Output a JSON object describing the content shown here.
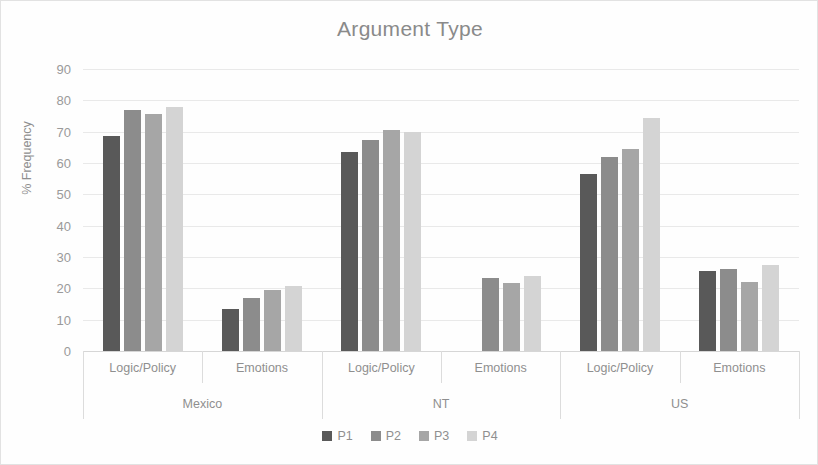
{
  "chart_data": {
    "type": "bar",
    "title": "Argument Type",
    "xlabel": "",
    "ylabel": "% Frequency",
    "ylim": [
      0,
      90
    ],
    "ytick_step": 10,
    "yticks": [
      90,
      80,
      70,
      60,
      50,
      40,
      30,
      20,
      10,
      0
    ],
    "grid": true,
    "legend_position": "bottom",
    "groups": [
      "Mexico",
      "NT",
      "US"
    ],
    "subcategories": [
      "Logic/Policy",
      "Emotions"
    ],
    "categories": [
      "Mexico - Logic/Policy",
      "Mexico - Emotions",
      "NT - Logic/Policy",
      "NT - Emotions",
      "US - Logic/Policy",
      "US - Emotions"
    ],
    "series": [
      {
        "name": "P1",
        "color": "#595959",
        "values": [
          68.5,
          13.3,
          63.5,
          null,
          56.5,
          25.5
        ]
      },
      {
        "name": "P2",
        "color": "#8c8c8c",
        "values": [
          77.0,
          16.8,
          67.5,
          23.2,
          62.0,
          26.1
        ]
      },
      {
        "name": "P3",
        "color": "#a6a6a6",
        "values": [
          75.5,
          19.4,
          70.5,
          21.7,
          64.5,
          21.9
        ]
      },
      {
        "name": "P4",
        "color": "#d4d4d4",
        "values": [
          78.0,
          20.7,
          70.0,
          24.0,
          74.3,
          27.3
        ]
      }
    ]
  },
  "legend": {
    "items": [
      {
        "label": "P1"
      },
      {
        "label": "P2"
      },
      {
        "label": "P3"
      },
      {
        "label": "P4"
      }
    ]
  }
}
